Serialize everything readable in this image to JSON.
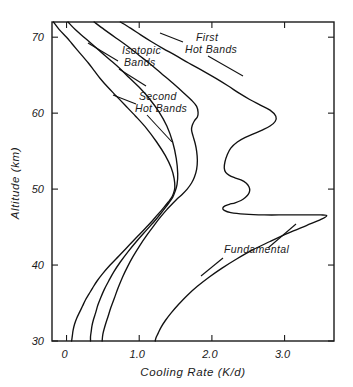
{
  "chart_data": {
    "type": "line",
    "title": "",
    "xlabel": "Cooling Rate (K/d)",
    "ylabel": "Altitude (km)",
    "xlim": [
      -0.2,
      3.68
    ],
    "ylim": [
      30,
      72
    ],
    "xticks": [
      "0",
      "1.0",
      "2.0",
      "3.0"
    ],
    "xtick_values": [
      0,
      1.0,
      2.0,
      3.0
    ],
    "yticks": [
      "30",
      "40",
      "50",
      "60",
      "70"
    ],
    "ytick_values": [
      30,
      40,
      50,
      60,
      70
    ],
    "grid": false,
    "legend_position": "inline-annotations",
    "annotations": [
      {
        "name": "isotopic-bands",
        "line1": "Isotopic",
        "line2": "Bands"
      },
      {
        "name": "first-hot-bands",
        "line1": "First",
        "line2": "Hot Bands"
      },
      {
        "name": "second-hot-bands",
        "line1": "Second",
        "line2": "Hot Bands"
      },
      {
        "name": "fundamental",
        "line1": "Fundamental",
        "line2": ""
      }
    ],
    "series": [
      {
        "name": "Isotopic Bands",
        "x": [
          -0.18,
          -0.1,
          0.0,
          0.07,
          0.14,
          0.22,
          0.3,
          0.38,
          0.46,
          0.56,
          0.68,
          0.8,
          0.95,
          1.1,
          1.24,
          1.36,
          1.44,
          1.48,
          1.49,
          1.47,
          1.44,
          1.4,
          1.34,
          1.25,
          1.14,
          1.0,
          0.86,
          0.72,
          0.6,
          0.5,
          0.42,
          0.36,
          0.31,
          0.26,
          0.22,
          0.18,
          0.14,
          0.11,
          0.09,
          0.08,
          0.07
        ],
        "y": [
          72.0,
          71.0,
          70.0,
          69.2,
          68.4,
          67.5,
          66.6,
          65.6,
          64.6,
          63.5,
          62.3,
          61.1,
          59.6,
          58.0,
          56.2,
          54.4,
          52.8,
          51.4,
          50.2,
          49.4,
          48.8,
          48.3,
          47.6,
          46.6,
          45.4,
          44.0,
          42.6,
          41.2,
          40.0,
          38.9,
          37.9,
          37.0,
          36.2,
          35.4,
          34.6,
          33.8,
          33.0,
          32.2,
          31.4,
          30.7,
          30.0
        ]
      },
      {
        "name": "Second Hot Bands",
        "x": [
          0.02,
          0.12,
          0.24,
          0.36,
          0.48,
          0.6,
          0.73,
          0.86,
          1.0,
          1.14,
          1.27,
          1.38,
          1.46,
          1.51,
          1.53,
          1.52,
          1.49,
          1.46,
          1.41,
          1.33,
          1.23,
          1.1,
          0.97,
          0.85,
          0.74,
          0.65,
          0.58,
          0.52,
          0.47,
          0.43,
          0.4,
          0.37,
          0.35,
          0.34,
          0.33,
          0.33
        ],
        "y": [
          72.0,
          71.0,
          70.0,
          69.0,
          68.0,
          67.0,
          65.9,
          64.7,
          63.4,
          61.9,
          60.2,
          58.3,
          56.2,
          54.0,
          52.0,
          50.6,
          49.6,
          48.9,
          48.2,
          47.2,
          46.0,
          44.6,
          43.2,
          41.8,
          40.4,
          39.1,
          37.9,
          36.8,
          35.7,
          34.7,
          33.7,
          32.8,
          32.0,
          31.3,
          30.6,
          30.0
        ]
      },
      {
        "name": "First Hot Bands",
        "x": [
          0.38,
          0.52,
          0.68,
          0.84,
          1.0,
          1.16,
          1.32,
          1.48,
          1.62,
          1.72,
          1.79,
          1.81,
          1.8,
          1.76,
          1.73,
          1.72,
          1.74,
          1.77,
          1.79,
          1.8,
          1.79,
          1.76,
          1.72,
          1.66,
          1.59,
          1.52,
          1.45,
          1.38,
          1.3,
          1.21,
          1.11,
          1.01,
          0.92,
          0.84,
          0.77,
          0.71,
          0.66,
          0.61,
          0.57,
          0.53,
          0.5,
          0.49
        ],
        "y": [
          72.0,
          71.0,
          69.9,
          68.8,
          67.6,
          66.4,
          65.1,
          63.8,
          62.6,
          61.7,
          60.9,
          60.1,
          59.5,
          59.0,
          58.4,
          57.8,
          57.0,
          56.0,
          55.0,
          53.8,
          52.6,
          51.6,
          50.8,
          50.0,
          49.3,
          48.7,
          48.0,
          47.3,
          46.4,
          45.3,
          44.0,
          42.6,
          41.2,
          39.8,
          38.4,
          37.0,
          35.7,
          34.4,
          33.2,
          32.0,
          30.9,
          30.0
        ]
      },
      {
        "name": "Fundamental",
        "x": [
          0.74,
          0.88,
          1.02,
          1.17,
          1.33,
          1.5,
          1.68,
          1.87,
          2.05,
          2.22,
          2.38,
          2.52,
          2.66,
          2.8,
          2.88,
          2.87,
          2.8,
          2.7,
          2.58,
          2.46,
          2.35,
          2.26,
          2.21,
          2.18,
          2.17,
          2.19,
          2.24,
          2.31,
          2.4,
          2.47,
          2.51,
          2.52,
          2.5,
          2.46,
          2.4,
          2.32,
          2.24,
          2.18,
          2.15,
          2.17,
          2.26,
          2.45,
          2.72,
          3.02,
          3.3,
          3.5,
          3.58,
          3.5,
          3.3,
          3.05,
          2.8,
          2.56,
          2.34,
          2.14,
          1.96,
          1.8,
          1.66,
          1.54,
          1.44,
          1.36,
          1.3,
          1.26,
          1.23,
          1.22
        ],
        "y": [
          72.0,
          71.2,
          70.3,
          69.4,
          68.5,
          67.6,
          66.6,
          65.6,
          64.6,
          63.6,
          62.6,
          61.8,
          61.1,
          60.4,
          59.6,
          58.9,
          58.3,
          57.8,
          57.3,
          56.8,
          56.2,
          55.4,
          54.5,
          53.6,
          52.8,
          52.2,
          51.8,
          51.5,
          51.2,
          50.8,
          50.3,
          49.8,
          49.3,
          48.9,
          48.5,
          48.2,
          48.0,
          47.8,
          47.5,
          47.2,
          46.9,
          46.7,
          46.6,
          46.6,
          46.6,
          46.6,
          46.5,
          46.0,
          45.2,
          44.2,
          43.1,
          42.0,
          40.8,
          39.6,
          38.4,
          37.2,
          36.0,
          34.8,
          33.7,
          32.7,
          31.8,
          31.0,
          30.4,
          30.0
        ]
      }
    ]
  }
}
